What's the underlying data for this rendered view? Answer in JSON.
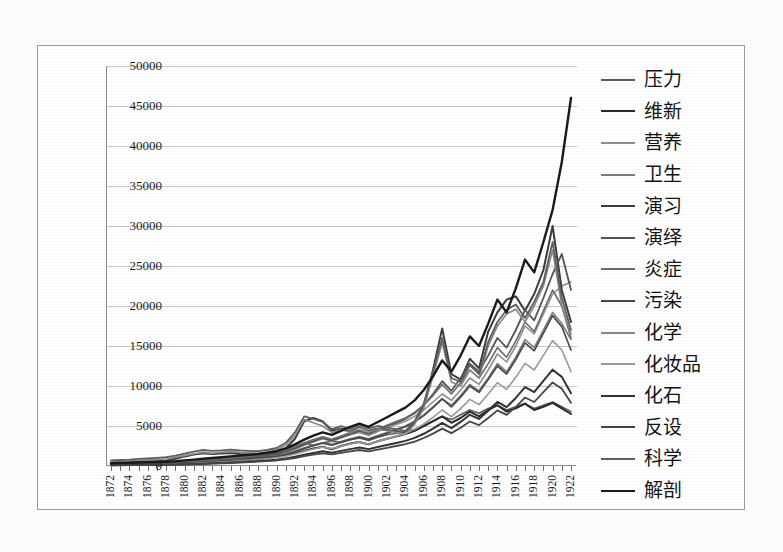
{
  "figure": {
    "caption": "",
    "border_color": "#9a9a9a",
    "background": "#ffffff"
  },
  "chart_data": {
    "type": "line",
    "title": "",
    "xlabel": "",
    "ylabel": "",
    "xlim": [
      1872,
      1922
    ],
    "ylim": [
      0,
      50000
    ],
    "ytick_step": 5000,
    "grid": true,
    "legend_position": "right",
    "yticks": [
      0,
      5000,
      10000,
      15000,
      20000,
      25000,
      30000,
      35000,
      40000,
      45000,
      50000
    ],
    "ytick_labels": [
      "0",
      "5000",
      "10000",
      "15000",
      "20000",
      "25000",
      "30000",
      "35000",
      "40000",
      "45000",
      "50000"
    ],
    "x": [
      1872,
      1873,
      1874,
      1875,
      1876,
      1877,
      1878,
      1879,
      1880,
      1881,
      1882,
      1883,
      1884,
      1885,
      1886,
      1887,
      1888,
      1889,
      1890,
      1891,
      1892,
      1893,
      1894,
      1895,
      1896,
      1897,
      1898,
      1899,
      1900,
      1901,
      1902,
      1903,
      1904,
      1905,
      1906,
      1907,
      1908,
      1909,
      1910,
      1911,
      1912,
      1913,
      1914,
      1915,
      1916,
      1917,
      1918,
      1919,
      1920,
      1921,
      1922
    ],
    "xtick_labels": [
      "1872",
      "1874",
      "1876",
      "1878",
      "1880",
      "1882",
      "1884",
      "1886",
      "1888",
      "1890",
      "1892",
      "1894",
      "1896",
      "1898",
      "1900",
      "1902",
      "1904",
      "1906",
      "1908",
      "1910",
      "1912",
      "1914",
      "1916",
      "1918",
      "1920",
      "1922"
    ],
    "xtick_label_step": 2,
    "series": [
      {
        "name": "压力",
        "color": "#5a5a5a",
        "width": 1.6,
        "values": [
          300,
          320,
          340,
          360,
          380,
          400,
          420,
          500,
          600,
          700,
          800,
          900,
          1000,
          1100,
          1200,
          1300,
          1400,
          1500,
          1700,
          2000,
          2400,
          2800,
          2600,
          2900,
          3100,
          3000,
          3300,
          3500,
          3200,
          3600,
          3900,
          4100,
          4300,
          4600,
          5000,
          5600,
          6200,
          5800,
          6400,
          7000,
          6600,
          7200,
          7600,
          7000,
          7400,
          7800,
          7200,
          7600,
          8000,
          7400,
          6800
        ]
      },
      {
        "name": "维新",
        "color": "#2a2a2a",
        "width": 2.0,
        "values": [
          250,
          260,
          280,
          300,
          320,
          340,
          360,
          400,
          450,
          500,
          560,
          620,
          700,
          760,
          820,
          900,
          980,
          1100,
          1200,
          1400,
          1600,
          1900,
          2200,
          2400,
          2100,
          2500,
          2800,
          3000,
          2700,
          3100,
          3400,
          3700,
          4000,
          4400,
          5000,
          5600,
          6200,
          5400,
          6000,
          6800,
          6200,
          7000,
          7600,
          6800,
          7200,
          7800,
          7000,
          7400,
          7900,
          7200,
          6500
        ]
      },
      {
        "name": "营养",
        "color": "#8e8e8e",
        "width": 1.6,
        "values": [
          200,
          210,
          230,
          250,
          270,
          290,
          320,
          350,
          400,
          450,
          520,
          600,
          700,
          800,
          900,
          1000,
          1100,
          1250,
          1400,
          1700,
          2100,
          2600,
          3000,
          3400,
          3100,
          3500,
          3900,
          4200,
          3800,
          4300,
          4800,
          5200,
          5600,
          6200,
          7000,
          8000,
          9000,
          8200,
          9500,
          11000,
          10200,
          12000,
          14000,
          13000,
          15000,
          17500,
          16500,
          19000,
          21500,
          22500,
          23000
        ]
      },
      {
        "name": "卫生",
        "color": "#7c7c7c",
        "width": 1.6,
        "values": [
          180,
          200,
          220,
          240,
          260,
          280,
          310,
          340,
          380,
          430,
          490,
          560,
          640,
          720,
          810,
          900,
          1000,
          1120,
          1260,
          1500,
          1850,
          2250,
          2600,
          2900,
          2700,
          3050,
          3400,
          3700,
          3400,
          3800,
          4200,
          4600,
          5000,
          5600,
          6400,
          7400,
          8400,
          7600,
          8800,
          10200,
          9400,
          11000,
          12800,
          11800,
          13600,
          15800,
          14800,
          17000,
          19200,
          17800,
          15800
        ]
      },
      {
        "name": "演习",
        "color": "#3c3c3c",
        "width": 2.0,
        "values": [
          400,
          430,
          470,
          520,
          560,
          600,
          660,
          900,
          1200,
          1450,
          1600,
          1500,
          1550,
          1620,
          1500,
          1450,
          1400,
          1500,
          1700,
          2200,
          3400,
          5600,
          6000,
          5600,
          4400,
          4700,
          4300,
          4900,
          4400,
          4700,
          4500,
          4300,
          4100,
          5400,
          7600,
          12000,
          17200,
          11500,
          10800,
          13400,
          12200,
          16800,
          19200,
          20800,
          21200,
          19400,
          21500,
          24500,
          30000,
          22000,
          18000
        ]
      },
      {
        "name": "演绎",
        "color": "#555555",
        "width": 1.8,
        "values": [
          220,
          240,
          260,
          280,
          300,
          330,
          360,
          400,
          450,
          510,
          580,
          660,
          750,
          850,
          960,
          1080,
          1200,
          1350,
          1520,
          1800,
          2200,
          2700,
          3100,
          3500,
          3200,
          3600,
          4000,
          4400,
          4000,
          4500,
          5000,
          5400,
          5900,
          6600,
          7600,
          9000,
          10600,
          9400,
          11000,
          12800,
          11800,
          13800,
          16000,
          14800,
          17000,
          19500,
          18200,
          21000,
          24000,
          26500,
          22000
        ]
      },
      {
        "name": "炎症",
        "color": "#6b6b6b",
        "width": 1.6,
        "values": [
          260,
          280,
          300,
          330,
          360,
          390,
          420,
          470,
          530,
          600,
          680,
          770,
          870,
          980,
          1100,
          1230,
          1380,
          1540,
          1740,
          2050,
          2450,
          2900,
          3300,
          3650,
          3350,
          3750,
          4150,
          4500,
          4100,
          4600,
          5100,
          5550,
          6000,
          6700,
          7600,
          8800,
          10200,
          9000,
          10400,
          12000,
          11000,
          12800,
          14800,
          13600,
          15600,
          18000,
          16800,
          19400,
          22000,
          20000,
          16000
        ]
      },
      {
        "name": "污染",
        "color": "#4a4a4a",
        "width": 1.7,
        "values": [
          150,
          170,
          190,
          210,
          230,
          250,
          280,
          310,
          350,
          400,
          460,
          530,
          610,
          690,
          780,
          880,
          980,
          1100,
          1240,
          1470,
          1800,
          2200,
          2550,
          2850,
          2600,
          2950,
          3300,
          3600,
          3300,
          3700,
          4100,
          4500,
          4900,
          5500,
          6300,
          7300,
          8400,
          7400,
          8600,
          10000,
          9200,
          10800,
          12500,
          11500,
          13300,
          15400,
          14400,
          16600,
          18800,
          17400,
          14500
        ]
      },
      {
        "name": "化学",
        "color": "#888888",
        "width": 1.6,
        "values": [
          500,
          560,
          620,
          700,
          760,
          820,
          900,
          1100,
          1300,
          1500,
          1700,
          1600,
          1700,
          1800,
          1700,
          1650,
          1600,
          1750,
          2000,
          2600,
          3800,
          5800,
          5400,
          5000,
          4200,
          4600,
          4200,
          4800,
          4300,
          4600,
          4400,
          4200,
          4000,
          5200,
          7200,
          11200,
          15400,
          10500,
          10000,
          12000,
          11000,
          15000,
          17500,
          19000,
          19600,
          18000,
          20000,
          22500,
          27000,
          20000,
          16500
        ]
      },
      {
        "name": "化妆品",
        "color": "#9b9b9b",
        "width": 1.6,
        "values": [
          120,
          130,
          140,
          160,
          180,
          200,
          220,
          250,
          280,
          320,
          370,
          430,
          490,
          560,
          640,
          720,
          810,
          910,
          1030,
          1220,
          1500,
          1830,
          2120,
          2380,
          2170,
          2460,
          2750,
          3000,
          2750,
          3080,
          3420,
          3750,
          4080,
          4580,
          5250,
          6080,
          7000,
          6170,
          7170,
          8330,
          7670,
          9000,
          10420,
          9580,
          11080,
          12830,
          12000,
          13830,
          15670,
          14500,
          11800
        ]
      },
      {
        "name": "化石",
        "color": "#333333",
        "width": 2.0,
        "values": [
          100,
          110,
          120,
          130,
          145,
          160,
          175,
          195,
          220,
          250,
          285,
          330,
          380,
          430,
          490,
          550,
          620,
          700,
          790,
          940,
          1150,
          1400,
          1630,
          1830,
          1670,
          1890,
          2110,
          2300,
          2110,
          2370,
          2630,
          2880,
          3140,
          3520,
          4030,
          4670,
          5380,
          4740,
          5510,
          6400,
          5890,
          6910,
          8010,
          7360,
          8510,
          9860,
          9220,
          10630,
          12040,
          11140,
          9100
        ]
      },
      {
        "name": "反设",
        "color": "#464646",
        "width": 1.8,
        "values": [
          90,
          95,
          105,
          115,
          125,
          140,
          155,
          170,
          190,
          220,
          250,
          290,
          330,
          375,
          425,
          480,
          540,
          610,
          690,
          815,
          1000,
          1220,
          1420,
          1590,
          1450,
          1640,
          1830,
          2000,
          1830,
          2050,
          2280,
          2500,
          2720,
          3050,
          3500,
          4050,
          4670,
          4110,
          4780,
          5560,
          5110,
          6000,
          6950,
          6390,
          7390,
          8560,
          8000,
          9220,
          10450,
          9670,
          7900
        ]
      },
      {
        "name": "科学",
        "color": "#5f5f5f",
        "width": 1.8,
        "values": [
          700,
          750,
          800,
          880,
          950,
          1020,
          1100,
          1300,
          1550,
          1800,
          2000,
          1900,
          1950,
          2050,
          1950,
          1900,
          1850,
          2000,
          2250,
          2900,
          4200,
          6200,
          5900,
          5500,
          4600,
          5000,
          4600,
          5200,
          4700,
          5000,
          4800,
          4600,
          4400,
          5600,
          7800,
          11800,
          16000,
          11000,
          10500,
          12600,
          11500,
          15500,
          18000,
          19500,
          20200,
          18500,
          20500,
          23000,
          28000,
          21000,
          17000
        ]
      },
      {
        "name": "解剖",
        "color": "#1a1a1a",
        "width": 2.4,
        "values": [
          350,
          380,
          400,
          430,
          470,
          500,
          540,
          600,
          700,
          800,
          900,
          1000,
          1100,
          1200,
          1300,
          1400,
          1500,
          1650,
          1850,
          2200,
          2700,
          3300,
          3800,
          4200,
          3900,
          4400,
          4900,
          5300,
          4900,
          5500,
          6100,
          6700,
          7300,
          8200,
          9500,
          11200,
          13200,
          11800,
          13800,
          16200,
          15000,
          17800,
          20800,
          19200,
          22200,
          25800,
          24200,
          28000,
          32000,
          38000,
          46000
        ]
      }
    ]
  }
}
